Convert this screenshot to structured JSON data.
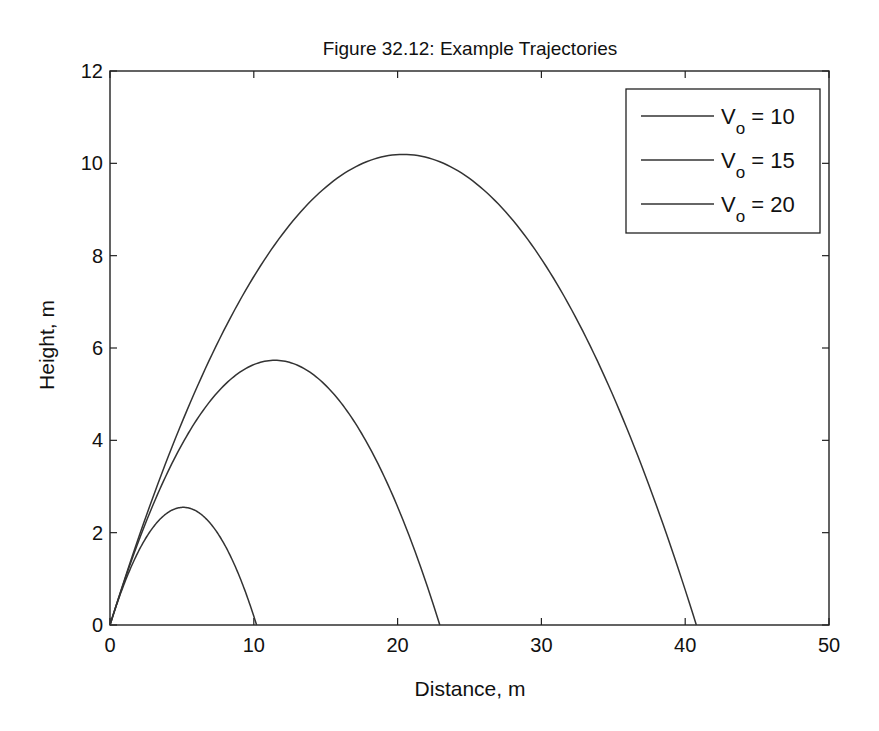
{
  "chart_data": {
    "type": "line",
    "title": "Figure 32.12: Example Trajectories",
    "xlabel": "Distance, m",
    "ylabel": "Height, m",
    "xlim": [
      0,
      50
    ],
    "ylim": [
      0,
      12
    ],
    "xticks": [
      0,
      10,
      20,
      30,
      40,
      50
    ],
    "yticks": [
      0,
      2,
      4,
      6,
      8,
      10,
      12
    ],
    "grid": false,
    "legend_position": "upper right",
    "series": [
      {
        "name": "Vo = 10",
        "v0": 10,
        "angle_deg": 45,
        "range_m": 10.19,
        "max_height_m": 2.55,
        "peak_x_m": 5.1,
        "x": [
          0,
          1,
          2,
          3,
          4,
          5,
          5.1,
          6,
          7,
          8,
          9,
          10,
          10.19
        ],
        "y": [
          0,
          0.9,
          1.61,
          2.12,
          2.43,
          2.55,
          2.55,
          2.47,
          2.19,
          1.72,
          1.06,
          0.19,
          0
        ]
      },
      {
        "name": "Vo = 15",
        "v0": 15,
        "angle_deg": 45,
        "range_m": 22.94,
        "max_height_m": 5.73,
        "peak_x_m": 11.47,
        "x": [
          0,
          2,
          4,
          6,
          8,
          10,
          11.47,
          14,
          16,
          18,
          20,
          22,
          22.94
        ],
        "y": [
          0,
          1.83,
          3.3,
          4.43,
          5.21,
          5.64,
          5.73,
          5.46,
          4.98,
          4.21,
          3.13,
          1.75,
          0
        ]
      },
      {
        "name": "Vo = 20",
        "v0": 20,
        "angle_deg": 45,
        "range_m": 40.77,
        "max_height_m": 10.19,
        "peak_x_m": 20.39,
        "x": [
          0,
          5,
          10,
          15,
          20.39,
          25,
          30,
          35,
          40,
          40.77
        ],
        "y": [
          0,
          4.39,
          7.55,
          9.48,
          10.19,
          9.67,
          7.93,
          4.96,
          0.76,
          0
        ]
      }
    ]
  },
  "figure": {
    "title": "Figure 32.12: Example Trajectories",
    "xlabel": "Distance, m",
    "ylabel": "Height, m",
    "xtick_labels": [
      "0",
      "10",
      "20",
      "30",
      "40",
      "50"
    ],
    "ytick_labels": [
      "0",
      "2",
      "4",
      "6",
      "8",
      "10",
      "12"
    ],
    "legend": [
      {
        "symbol": "V",
        "subscript": "o",
        "text": " = 10"
      },
      {
        "symbol": "V",
        "subscript": "o",
        "text": " = 15"
      },
      {
        "symbol": "V",
        "subscript": "o",
        "text": " = 20"
      }
    ],
    "line_color": "#333333",
    "axis_color": "#222222"
  }
}
